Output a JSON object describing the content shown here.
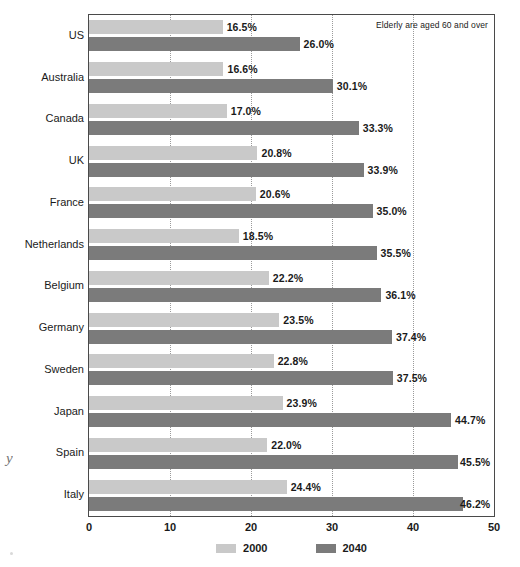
{
  "chart_data": {
    "type": "bar",
    "orientation": "horizontal",
    "grouped": true,
    "title": "",
    "subtitle": "",
    "xlabel": "",
    "ylabel": "",
    "xlim": [
      0,
      50
    ],
    "xticks": [
      "0",
      "10",
      "20",
      "30",
      "40",
      "50"
    ],
    "xtick_values": [
      0,
      10,
      20,
      30,
      40,
      50
    ],
    "grid": "vertical-dotted",
    "legend_position": "bottom-center",
    "value_label_suffix": "%",
    "categories": [
      "US",
      "Australia",
      "Canada",
      "UK",
      "France",
      "Netherlands",
      "Belgium",
      "Germany",
      "Sweden",
      "Japan",
      "Spain",
      "Italy"
    ],
    "series": [
      {
        "name": "2000",
        "color": "#c9c9c9",
        "values": [
          16.5,
          16.6,
          17.0,
          20.8,
          20.6,
          18.5,
          22.2,
          23.5,
          22.8,
          23.9,
          22.0,
          24.4
        ],
        "labels": [
          "16.5%",
          "16.6%",
          "17.0%",
          "20.8%",
          "20.6%",
          "18.5%",
          "22.2%",
          "23.5%",
          "22.8%",
          "23.9%",
          "22.0%",
          "24.4%"
        ]
      },
      {
        "name": "2040",
        "color": "#7b7b7b",
        "values": [
          26.0,
          30.1,
          33.3,
          33.9,
          35.0,
          35.5,
          36.1,
          37.4,
          37.5,
          44.7,
          45.5,
          46.2
        ],
        "labels": [
          "26.0%",
          "30.1%",
          "33.3%",
          "33.9%",
          "35.0%",
          "35.5%",
          "36.1%",
          "37.4%",
          "37.5%",
          "44.7%",
          "45.5%",
          "46.2%"
        ]
      }
    ],
    "annotation": "Elderly are aged 60 and over"
  },
  "legend": {
    "items": [
      {
        "label": "2000"
      },
      {
        "label": "2040"
      }
    ]
  },
  "artifacts": {
    "margin_glyph": "y"
  }
}
